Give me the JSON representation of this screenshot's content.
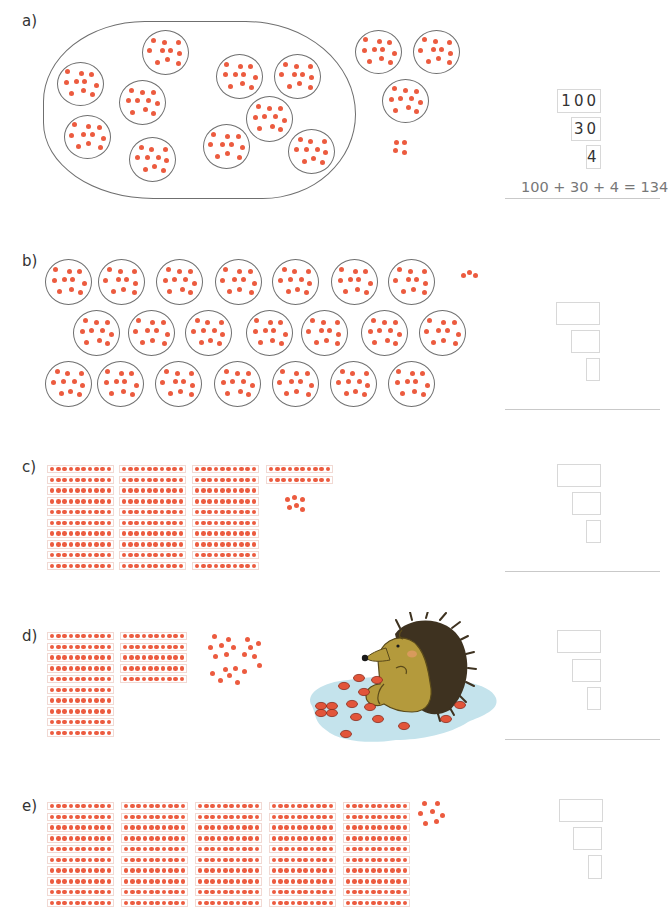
{
  "exercise": {
    "parts": [
      {
        "label": "a)",
        "answer_boxes": [
          "100",
          "30",
          "4"
        ],
        "equation": "100 + 30 + 4 = 134",
        "representation": "10 dot-circles of ten inside a large enclosure, 3 dot-circles of ten outside, 4 loose dots"
      },
      {
        "label": "b)",
        "answer_boxes": [
          "",
          "",
          ""
        ],
        "equation": "",
        "representation": "21 dot-circles of ten in 3 rows of 7, 3 loose dots"
      },
      {
        "label": "c)",
        "answer_boxes": [
          "",
          "",
          ""
        ],
        "equation": "",
        "representation": "3 hundred-blocks, 2 ten-strips, 6 loose dots"
      },
      {
        "label": "d)",
        "answer_boxes": [
          "",
          "",
          ""
        ],
        "equation": "",
        "representation": "1 hundred-block, 5 ten-strips, 20 loose dots, hedgehog illustration with red counters on a blue puddle"
      },
      {
        "label": "e)",
        "answer_boxes": [
          "",
          "",
          ""
        ],
        "equation": "",
        "representation": "5 hundred-blocks, 7 loose dots"
      }
    ]
  },
  "colors": {
    "dot": "#ec5b3f",
    "circle_outline": "#6f6f6f",
    "box_border": "#d8d8d8",
    "divider": "#c9c9c9",
    "puddle": "#bfe0ea",
    "hedgehog_body": "#b49a3c",
    "hedgehog_spines": "#4a3a1e"
  }
}
